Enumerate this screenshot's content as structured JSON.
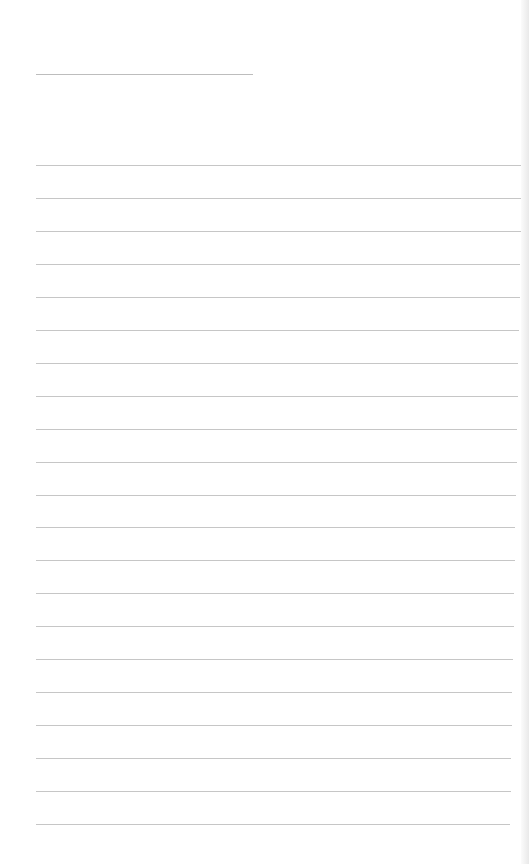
{
  "page": {
    "type": "lined-note-paper",
    "background": "#ffffff",
    "line_color": "#c6c6c6",
    "title_line": {
      "x": 36,
      "y": 74,
      "width": 217
    },
    "rules": {
      "x": 36,
      "start_y": 165,
      "spacing": 32.95,
      "count": 21,
      "width": 486
    }
  }
}
